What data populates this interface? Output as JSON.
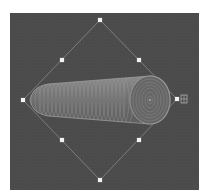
{
  "viewport": {
    "background": "#4b4b4b",
    "outer_background": "#ffffff"
  },
  "selection": {
    "object": "tapered-cylinder",
    "bounding_shape": "diamond",
    "outline_color": "#8a8a8a",
    "handles": [
      {
        "name": "top",
        "x": 100,
        "y": 20
      },
      {
        "name": "top-left",
        "x": 62,
        "y": 60
      },
      {
        "name": "top-right",
        "x": 139,
        "y": 60
      },
      {
        "name": "left",
        "x": 23,
        "y": 100
      },
      {
        "name": "right",
        "x": 177,
        "y": 99
      },
      {
        "name": "bottom-left",
        "x": 62,
        "y": 140
      },
      {
        "name": "bottom-right",
        "x": 139,
        "y": 140
      },
      {
        "name": "bottom",
        "x": 100,
        "y": 180
      }
    ],
    "rotate_icon": "rotate-icon"
  },
  "object": {
    "fill": "#707070",
    "ring_color": "#9a9a9a",
    "highlight": "#a8a8a8"
  }
}
